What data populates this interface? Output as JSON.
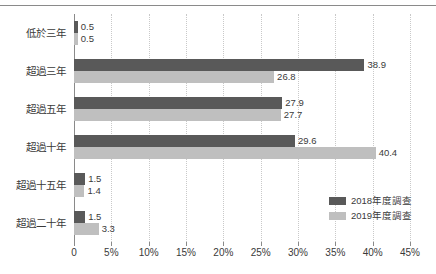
{
  "chart_data": {
    "type": "bar",
    "orientation": "horizontal",
    "title": "",
    "subtitle": "",
    "xlabel": "",
    "ylabel": "",
    "xlim": [
      0,
      45
    ],
    "xticks": [
      0,
      5,
      10,
      15,
      20,
      25,
      30,
      35,
      40,
      45
    ],
    "xtick_labels": [
      "0",
      "5%",
      "10%",
      "15%",
      "20%",
      "25%",
      "30%",
      "35%",
      "40%",
      "45%"
    ],
    "grid": "vertical-dotted",
    "legend_position": "inside-right-lower",
    "categories": [
      "低於三年",
      "超過三年",
      "超過五年",
      "超過十年",
      "超過十五年",
      "超過二十年"
    ],
    "series": [
      {
        "name": "2018年度調查",
        "color": "#595959",
        "values": [
          0.5,
          38.9,
          27.9,
          29.6,
          1.5,
          1.5
        ],
        "value_labels": [
          "0.5",
          "38.9",
          "27.9",
          "29.6",
          "1.5",
          "1.5"
        ]
      },
      {
        "name": "2019年度調查",
        "color": "#bfbfbf",
        "values": [
          0.5,
          26.8,
          27.7,
          40.4,
          1.4,
          3.3
        ],
        "value_labels": [
          "0.5",
          "26.8",
          "27.7",
          "40.4",
          "1.4",
          "3.3"
        ]
      }
    ]
  },
  "colors": {
    "series_2018": "#595959",
    "series_2019": "#bfbfbf",
    "axis": "#8a8a8a",
    "gridline": "#c9c9c9",
    "text": "#3a3a3a",
    "background": "#ffffff"
  }
}
